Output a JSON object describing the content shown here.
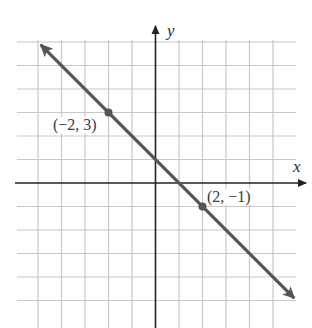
{
  "chart_data": {
    "type": "line",
    "title": "",
    "xlabel": "x",
    "ylabel": "y",
    "xlim": [
      -6,
      6
    ],
    "ylim": [
      -6,
      6
    ],
    "grid": true,
    "grid_step": 1,
    "series": [
      {
        "name": "line through (-2, 3) and (2, -1)",
        "equation": "y = -x + 1",
        "slope": -1,
        "intercept": 1,
        "x": [
          -2,
          2
        ],
        "y": [
          3,
          -1
        ],
        "arrows_both_ends": true,
        "color": "#555555"
      }
    ],
    "points": [
      {
        "x": -2,
        "y": 3,
        "label": "(−2, 3)"
      },
      {
        "x": 2,
        "y": -1,
        "label": "(2, −1)"
      }
    ],
    "annotations": [
      "(−2, 3)",
      "(2, −1)"
    ]
  },
  "colors": {
    "grid": "#c8c8c8",
    "axis": "#222222",
    "line": "#555555",
    "point": "#555555"
  },
  "labels": {
    "x_axis": "x",
    "y_axis": "y",
    "point_a": "(−2, 3)",
    "point_b": "(2, −1)"
  }
}
